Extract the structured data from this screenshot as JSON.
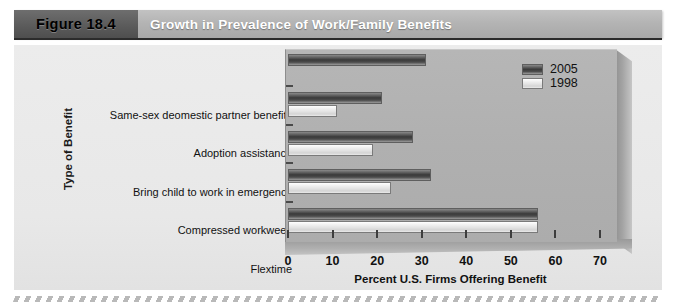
{
  "header": {
    "figure_number": "Figure 18.4",
    "figure_title": "Growth in Prevalence of Work/Family Benefits"
  },
  "colors": {
    "header_band": "#b4b4b4",
    "figure_number_box": "#5a5a5a",
    "panel_background": "#e8e8e8",
    "plot_face": "#b0b0b0",
    "series_2005": "#3a3a3a",
    "series_1998": "#eeeeee",
    "axis": "#3d3d3d"
  },
  "chart_data": {
    "type": "bar",
    "orientation": "horizontal",
    "title": "Growth in Prevalence of Work/Family Benefits",
    "xlabel": "Percent U.S. Firms Offering Benefit",
    "ylabel": "Type of Benefit",
    "xlim": [
      0,
      70
    ],
    "xticks": [
      0,
      10,
      20,
      30,
      40,
      50,
      60,
      70
    ],
    "xtick_labels": [
      "0",
      "10",
      "20",
      "30",
      "40",
      "50",
      "60",
      "70"
    ],
    "grid": false,
    "legend_position": "top-right",
    "categories": [
      "Same-sex deomestic partner benefits",
      "Adoption assistance",
      "Bring child to work in emergency",
      "Compressed workweek",
      "Flextime"
    ],
    "series": [
      {
        "name": "2005",
        "values": [
          31,
          21,
          28,
          32,
          56
        ]
      },
      {
        "name": "1998",
        "values": [
          null,
          11,
          19,
          23,
          56
        ]
      }
    ]
  }
}
